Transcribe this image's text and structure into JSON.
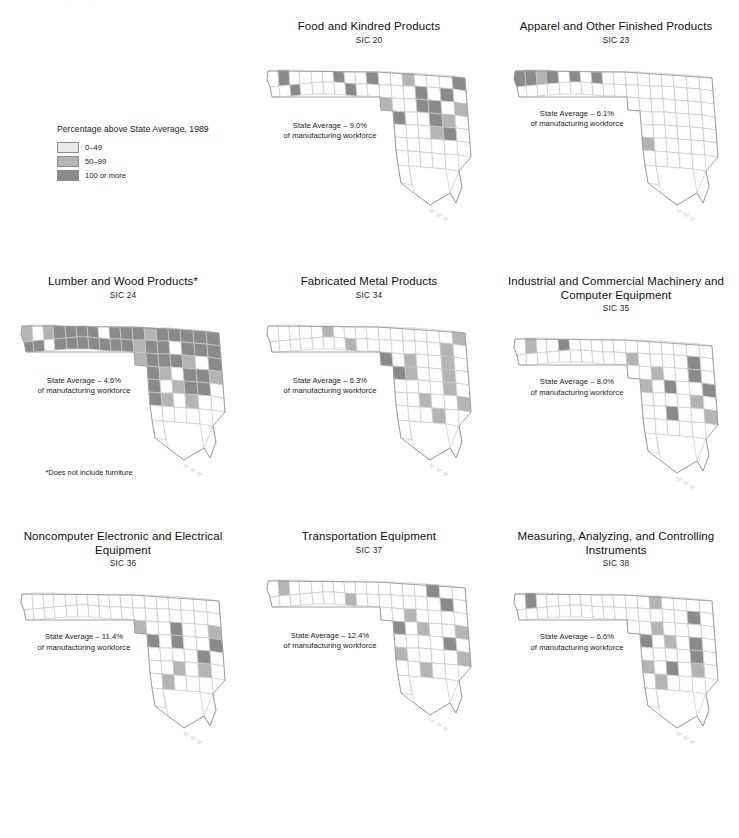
{
  "page": {
    "top_artifact": "· ··  ·  ·· ·   · ··  ·",
    "avg_suffix": "of manufacturing workforce"
  },
  "legend": {
    "title": "Percentage above State Average, 1989",
    "items": [
      {
        "label": "0–49",
        "color": "#e8e8e8"
      },
      {
        "label": "50–99",
        "color": "#b4b4b4"
      },
      {
        "label": "100 or more",
        "color": "#8a8a8a"
      }
    ]
  },
  "colors": {
    "class_low": "#e8e8e8",
    "class_mid": "#b4b4b4",
    "class_high": "#8a8a8a",
    "class_none": "#ffffff",
    "county_stroke": "#c9c9c9",
    "state_stroke": "#9a9a9a",
    "text": "#1a1a1a"
  },
  "panels": [
    {
      "title": "Food and Kindred Products",
      "sic": "SIC 20",
      "state_average": "State Average – 9.0%",
      "footnote": null,
      "classes": {
        "1": 0,
        "2": 3,
        "3": 0,
        "4": 0,
        "5": 0,
        "6": 0,
        "7": 3,
        "8": 0,
        "9": 0,
        "10": 3,
        "11": 0,
        "12": 0,
        "13": 3,
        "14": 0,
        "15": 0,
        "16": 0,
        "17": 0,
        "18": 3,
        "19": 0,
        "20": 0,
        "21": 0,
        "22": 0,
        "23": 2,
        "24": 0,
        "25": 0,
        "26": 0,
        "27": 3,
        "28": 0,
        "29": 0,
        "30": 0,
        "31": 3,
        "32": 0,
        "33": 3,
        "34": 0,
        "35": 2,
        "36": 0,
        "37": 0,
        "38": 3,
        "39": 3,
        "40": 0,
        "41": 2,
        "42": 3,
        "43": 0,
        "44": 0,
        "45": 3,
        "46": 2,
        "47": 0,
        "48": 0,
        "49": 0,
        "50": 0,
        "51": 2,
        "52": 3,
        "53": 0,
        "54": 0,
        "55": 0,
        "56": 0,
        "57": 0,
        "58": 0,
        "59": 0,
        "60": 0,
        "61": 0,
        "62": 0,
        "63": 0,
        "64": 0,
        "65": 0,
        "66": 0,
        "67": 0
      }
    },
    {
      "title": "Apparel and Other Finished Products",
      "sic": "SIC 23",
      "state_average": "State Average – 6.1%",
      "footnote": null,
      "classes": {
        "1": 3,
        "2": 3,
        "3": 2,
        "4": 3,
        "5": 0,
        "6": 3,
        "7": 0,
        "8": 3,
        "9": 0,
        "10": 0,
        "11": 0,
        "12": 0,
        "13": 0,
        "14": 0,
        "15": 0,
        "16": 0,
        "17": 0,
        "18": 0,
        "19": 0,
        "20": 0,
        "21": 0,
        "22": 0,
        "23": 0,
        "24": 0,
        "25": 0,
        "26": 0,
        "27": 0,
        "28": 0,
        "29": 0,
        "30": 0,
        "31": 0,
        "32": 0,
        "33": 0,
        "34": 0,
        "35": 0,
        "36": 0,
        "37": 0,
        "38": 0,
        "39": 0,
        "40": 0,
        "41": 0,
        "42": 0,
        "43": 0,
        "44": 0,
        "45": 0,
        "46": 0,
        "47": 0,
        "48": 0,
        "49": 0,
        "50": 0,
        "51": 0,
        "52": 0,
        "53": 0,
        "54": 2,
        "55": 0,
        "56": 0,
        "57": 0,
        "58": 0,
        "59": 0,
        "60": 0,
        "61": 0,
        "62": 0,
        "63": 0,
        "64": 0,
        "65": 0,
        "66": 0,
        "67": 0
      }
    },
    {
      "title": "Industrial and Commercial Machinery and Computer Equipment",
      "sic": "SIC 35",
      "state_average": "State Average – 8.0%",
      "footnote": null,
      "classes": {
        "1": 0,
        "2": 2,
        "3": 0,
        "4": 0,
        "5": 3,
        "6": 0,
        "7": 0,
        "8": 0,
        "9": 0,
        "10": 0,
        "11": 0,
        "12": 0,
        "13": 0,
        "14": 0,
        "15": 0,
        "16": 0,
        "17": 0,
        "18": 0,
        "19": 0,
        "20": 0,
        "21": 0,
        "22": 0,
        "23": 0,
        "24": 0,
        "25": 0,
        "26": 0,
        "27": 0,
        "28": 2,
        "29": 0,
        "30": 0,
        "31": 0,
        "32": 0,
        "33": 3,
        "34": 0,
        "35": 0,
        "36": 0,
        "37": 2,
        "38": 0,
        "39": 0,
        "40": 3,
        "41": 0,
        "42": 2,
        "43": 0,
        "44": 3,
        "45": 0,
        "46": 0,
        "47": 3,
        "48": 0,
        "49": 0,
        "50": 0,
        "51": 0,
        "52": 2,
        "53": 0,
        "54": 0,
        "55": 0,
        "56": 3,
        "57": 0,
        "58": 0,
        "59": 2,
        "60": 0,
        "61": 0,
        "62": 0,
        "63": 0,
        "64": 0,
        "65": 0,
        "66": 0,
        "67": 0
      }
    },
    {
      "title": "Lumber and Wood Products*",
      "sic": "SIC 24",
      "state_average": "State Average – 4.6%",
      "footnote": "*Does not include furniture",
      "classes": {
        "1": 2,
        "2": 0,
        "3": 2,
        "4": 3,
        "5": 3,
        "6": 3,
        "7": 3,
        "8": 0,
        "9": 3,
        "10": 3,
        "11": 3,
        "12": 3,
        "13": 0,
        "14": 3,
        "15": 3,
        "16": 3,
        "17": 3,
        "18": 3,
        "19": 3,
        "20": 3,
        "21": 3,
        "22": 2,
        "23": 3,
        "24": 3,
        "25": 3,
        "26": 3,
        "27": 3,
        "28": 2,
        "29": 3,
        "30": 3,
        "31": 0,
        "32": 3,
        "33": 3,
        "34": 3,
        "35": 2,
        "36": 3,
        "37": 3,
        "38": 3,
        "39": 2,
        "40": 0,
        "41": 3,
        "42": 3,
        "43": 2,
        "44": 0,
        "45": 3,
        "46": 3,
        "47": 2,
        "48": 3,
        "49": 0,
        "50": 2,
        "51": 3,
        "52": 3,
        "53": 0,
        "54": 3,
        "55": 2,
        "56": 0,
        "57": 2,
        "58": 0,
        "59": 0,
        "60": 0,
        "61": 0,
        "62": 0,
        "63": 0,
        "64": 0,
        "65": 0,
        "66": 0,
        "67": 0
      }
    },
    {
      "title": "Fabricated Metal Products",
      "sic": "SIC 34",
      "state_average": "State Average – 6.3%",
      "footnote": null,
      "classes": {
        "1": 0,
        "2": 0,
        "3": 0,
        "4": 0,
        "5": 0,
        "6": 2,
        "7": 0,
        "8": 0,
        "9": 0,
        "10": 0,
        "11": 0,
        "12": 0,
        "13": 0,
        "14": 0,
        "15": 0,
        "16": 0,
        "17": 0,
        "18": 2,
        "19": 0,
        "20": 0,
        "21": 0,
        "22": 0,
        "23": 0,
        "24": 0,
        "25": 0,
        "26": 0,
        "27": 2,
        "28": 0,
        "29": 0,
        "30": 0,
        "31": 0,
        "32": 0,
        "33": 2,
        "34": 0,
        "35": 3,
        "36": 0,
        "37": 2,
        "38": 0,
        "39": 0,
        "40": 2,
        "41": 0,
        "42": 3,
        "43": 2,
        "44": 0,
        "45": 0,
        "46": 2,
        "47": 0,
        "48": 0,
        "49": 0,
        "50": 0,
        "51": 0,
        "52": 2,
        "53": 0,
        "54": 0,
        "55": 0,
        "56": 2,
        "57": 0,
        "58": 0,
        "59": 2,
        "60": 0,
        "61": 0,
        "62": 0,
        "63": 2,
        "64": 0,
        "65": 0,
        "66": 0,
        "67": 0
      }
    },
    {
      "title": "Noncomputer Electronic and Electrical Equipment",
      "sic": "SIC 36",
      "state_average": "State Average – 11.4%",
      "footnote": null,
      "classes": {
        "1": 0,
        "2": 0,
        "3": 0,
        "4": 0,
        "5": 0,
        "6": 0,
        "7": 0,
        "8": 0,
        "9": 0,
        "10": 0,
        "11": 0,
        "12": 0,
        "13": 0,
        "14": 0,
        "15": 0,
        "16": 0,
        "17": 0,
        "18": 0,
        "19": 0,
        "20": 0,
        "21": 0,
        "22": 0,
        "23": 0,
        "24": 0,
        "25": 0,
        "26": 0,
        "27": 0,
        "28": 0,
        "29": 0,
        "30": 0,
        "31": 0,
        "32": 0,
        "33": 0,
        "34": 0,
        "35": 2,
        "36": 0,
        "37": 0,
        "38": 3,
        "39": 0,
        "40": 0,
        "41": 2,
        "42": 3,
        "43": 0,
        "44": 3,
        "45": 0,
        "46": 0,
        "47": 3,
        "48": 0,
        "49": 0,
        "50": 0,
        "51": 0,
        "52": 3,
        "53": 0,
        "54": 0,
        "55": 0,
        "56": 2,
        "57": 0,
        "58": 2,
        "59": 0,
        "60": 0,
        "61": 2,
        "62": 0,
        "63": 0,
        "64": 0,
        "65": 0,
        "66": 0,
        "67": 0
      }
    },
    {
      "title": "Transportation Equipment",
      "sic": "SIC 37",
      "state_average": "State Average – 12.4%",
      "footnote": null,
      "classes": {
        "1": 0,
        "2": 2,
        "3": 0,
        "4": 0,
        "5": 0,
        "6": 0,
        "7": 0,
        "8": 0,
        "9": 0,
        "10": 0,
        "11": 0,
        "12": 0,
        "13": 0,
        "14": 0,
        "15": 0,
        "16": 0,
        "17": 0,
        "18": 2,
        "19": 0,
        "20": 0,
        "21": 0,
        "22": 0,
        "23": 0,
        "24": 0,
        "25": 3,
        "26": 0,
        "27": 0,
        "28": 0,
        "29": 0,
        "30": 0,
        "31": 0,
        "32": 0,
        "33": 3,
        "34": 0,
        "35": 0,
        "36": 0,
        "37": 2,
        "38": 0,
        "39": 0,
        "40": 0,
        "41": 0,
        "42": 3,
        "43": 0,
        "44": 2,
        "45": 0,
        "46": 0,
        "47": 2,
        "48": 0,
        "49": 0,
        "50": 0,
        "51": 0,
        "52": 3,
        "53": 0,
        "54": 2,
        "55": 0,
        "56": 0,
        "57": 0,
        "58": 0,
        "59": 2,
        "60": 0,
        "61": 0,
        "62": 2,
        "63": 0,
        "64": 0,
        "65": 0,
        "66": 0,
        "67": 0
      }
    },
    {
      "title": "Measuring, Analyzing, and Controlling Instruments",
      "sic": "SIC 38",
      "state_average": "State Average – 6.6%",
      "footnote": null,
      "classes": {
        "1": 0,
        "2": 3,
        "3": 0,
        "4": 0,
        "5": 0,
        "6": 0,
        "7": 0,
        "8": 0,
        "9": 0,
        "10": 0,
        "11": 0,
        "12": 0,
        "13": 0,
        "14": 0,
        "15": 0,
        "16": 0,
        "17": 0,
        "18": 0,
        "19": 0,
        "20": 0,
        "21": 0,
        "22": 0,
        "23": 2,
        "24": 0,
        "25": 0,
        "26": 0,
        "27": 0,
        "28": 0,
        "29": 0,
        "30": 0,
        "31": 0,
        "32": 0,
        "33": 3,
        "34": 0,
        "35": 0,
        "36": 0,
        "37": 2,
        "38": 0,
        "39": 0,
        "40": 0,
        "41": 0,
        "42": 3,
        "43": 0,
        "44": 2,
        "45": 0,
        "46": 3,
        "47": 0,
        "48": 0,
        "49": 0,
        "50": 0,
        "51": 0,
        "52": 3,
        "53": 0,
        "54": 2,
        "55": 0,
        "56": 3,
        "57": 0,
        "58": 2,
        "59": 0,
        "60": 0,
        "61": 2,
        "62": 0,
        "63": 0,
        "64": 0,
        "65": 0,
        "66": 0,
        "67": 0
      }
    }
  ],
  "panel_order": [
    0,
    1,
    3,
    4,
    2,
    5,
    6,
    7
  ],
  "panel_layout": [
    {
      "index": 0,
      "row": 0,
      "col": 1
    },
    {
      "index": 1,
      "row": 0,
      "col": 2
    },
    {
      "index": 3,
      "row": 1,
      "col": 0
    },
    {
      "index": 4,
      "row": 1,
      "col": 1
    },
    {
      "index": 2,
      "row": 1,
      "col": 2
    },
    {
      "index": 5,
      "row": 2,
      "col": 0
    },
    {
      "index": 6,
      "row": 2,
      "col": 1
    },
    {
      "index": 7,
      "row": 2,
      "col": 2
    }
  ]
}
